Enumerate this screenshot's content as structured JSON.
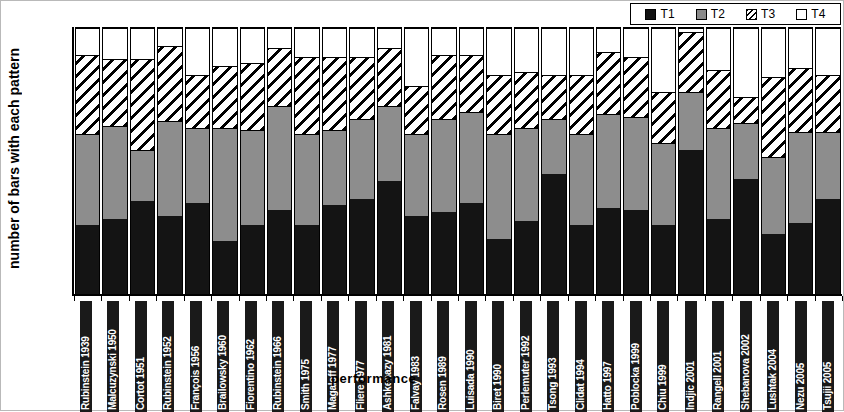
{
  "chart_data": {
    "type": "bar",
    "subtype": "stacked-vertical",
    "title": "",
    "xlabel": "performance",
    "ylabel": "number of bars with each pattern",
    "ylim": [
      0,
      120
    ],
    "yticks": [
      0,
      20,
      40,
      60,
      80,
      100,
      120
    ],
    "grid": false,
    "legend_position": "top-right",
    "legend": [
      "T1",
      "T2",
      "T3",
      "T4"
    ],
    "colors": {
      "T1": "#141414",
      "T2": "#8d8d8d",
      "T3": "#ffffff",
      "T4": "#ffffff"
    },
    "patterns": {
      "T1": "solid-black",
      "T2": "solid-gray",
      "T3": "diagonal-hatch",
      "T4": "solid-white"
    },
    "categories": [
      "Rubinstein 1939",
      "Malcuzynski 1950",
      "Cortot 1951",
      "Rubinstein 1952",
      "François 1956",
      "Brailowsky 1960",
      "Fiorentino 1962",
      "Rubinstein 1966",
      "Smith 1975",
      "Magaloff 1977",
      "Fliere 1977",
      "Ashkenazy 1981",
      "Falvay 1983",
      "Rosen 1989",
      "Luisada 1990",
      "Biret 1990",
      "Perlemuter 1992",
      "Tsong 1993",
      "Clidat 1994",
      "Hatto 1997",
      "Poblocka 1999",
      "Chiu 1999",
      "Indjic 2001",
      "Rangell 2001",
      "Shebanova 2002",
      "Lushtak 2004",
      "Nezu 2005",
      "Tsujii 2005"
    ],
    "series": [
      {
        "name": "T1",
        "values": [
          31,
          34,
          42,
          35,
          41,
          24,
          31,
          38,
          31,
          40,
          43,
          51,
          35,
          37,
          41,
          25,
          33,
          54,
          31,
          39,
          38,
          31,
          65,
          34,
          52,
          27,
          32,
          43
        ]
      },
      {
        "name": "T2",
        "values": [
          41,
          42,
          23,
          43,
          34,
          51,
          43,
          47,
          41,
          34,
          36,
          34,
          37,
          42,
          41,
          47,
          42,
          25,
          41,
          42,
          42,
          37,
          26,
          41,
          25,
          35,
          41,
          30
        ]
      },
      {
        "name": "T3",
        "values": [
          36,
          30,
          41,
          34,
          24,
          28,
          30,
          26,
          35,
          33,
          28,
          26,
          22,
          29,
          26,
          27,
          25,
          20,
          27,
          28,
          27,
          23,
          27,
          26,
          12,
          36,
          29,
          26
        ]
      },
      {
        "name": "T4",
        "values": [
          12,
          14,
          14,
          8,
          21,
          17,
          16,
          9,
          13,
          13,
          13,
          9,
          26,
          12,
          12,
          21,
          20,
          21,
          21,
          11,
          13,
          29,
          2,
          19,
          31,
          22,
          18,
          21
        ]
      }
    ],
    "stack_tops": {
      "T1": [
        31,
        34,
        42,
        35,
        41,
        24,
        31,
        38,
        31,
        40,
        43,
        51,
        35,
        37,
        41,
        25,
        33,
        54,
        31,
        39,
        38,
        31,
        65,
        34,
        52,
        27,
        32,
        43
      ],
      "T2": [
        72,
        76,
        65,
        78,
        75,
        75,
        74,
        85,
        72,
        74,
        79,
        85,
        72,
        79,
        82,
        72,
        75,
        79,
        72,
        81,
        80,
        68,
        91,
        75,
        77,
        62,
        73,
        73
      ],
      "T3": [
        108,
        106,
        106,
        112,
        99,
        103,
        104,
        111,
        107,
        107,
        107,
        111,
        94,
        108,
        108,
        99,
        100,
        99,
        99,
        109,
        107,
        91,
        118,
        101,
        89,
        98,
        102,
        99
      ],
      "T4": [
        120,
        120,
        120,
        120,
        120,
        120,
        120,
        120,
        120,
        120,
        120,
        120,
        120,
        120,
        120,
        120,
        120,
        120,
        120,
        120,
        120,
        120,
        120,
        120,
        120,
        120,
        120,
        120
      ]
    }
  },
  "axis": {
    "y_title": "number of bars with each pattern",
    "x_title": "performance"
  }
}
